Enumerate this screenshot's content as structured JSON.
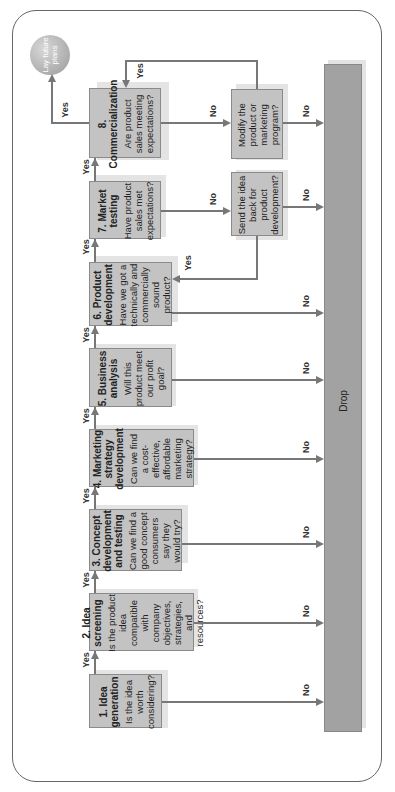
{
  "diagram": {
    "stages": [
      {
        "title": "1. Idea generation",
        "question": "Is the idea worth considering?"
      },
      {
        "title": "2. Idea screening",
        "question": "Is the product idea compatible with company objectives, strategies, and resources?"
      },
      {
        "title": "3. Concept development and testing",
        "question": "Can we find a good concept consumers say they would try?"
      },
      {
        "title": "4. Marketing strategy development",
        "question": "Can we find a cost-effective, affordable marketing strategy?"
      },
      {
        "title": "5. Business analysis",
        "question": "Will this product meet our profit goal?"
      },
      {
        "title": "6. Product development",
        "question": "Have we got a technically and commercially sound product?"
      },
      {
        "title": "7. Market testing",
        "question": "Have product sales met expectations?"
      },
      {
        "title": "8. Commercialization",
        "question": "Are product sales meeting expectations?"
      }
    ],
    "side_boxes": {
      "send_back": "Send the idea back for product development?",
      "modify": "Modify the product or marketing program?"
    },
    "terminal": "Lay future plans",
    "drop": "Drop",
    "yes_label": "Yes",
    "no_label": "No"
  }
}
